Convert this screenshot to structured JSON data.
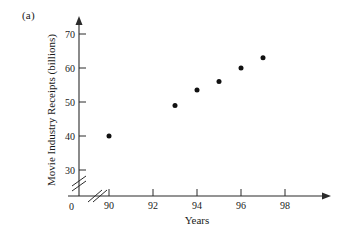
{
  "panel": {
    "label": "(a)"
  },
  "chart_data": {
    "type": "scatter",
    "title": "",
    "xlabel": "Years",
    "ylabel": "Movie Industry Receipts (billions)",
    "x": [
      90,
      93,
      94,
      95,
      96,
      97
    ],
    "values": [
      40,
      49,
      53.5,
      56,
      60,
      63
    ],
    "points": [
      {
        "x": 90,
        "y": 40
      },
      {
        "x": 93,
        "y": 49
      },
      {
        "x": 94,
        "y": 53.5
      },
      {
        "x": 95,
        "y": 56
      },
      {
        "x": 96,
        "y": 60
      },
      {
        "x": 97,
        "y": 63
      }
    ],
    "xticks": [
      90,
      92,
      94,
      96,
      98
    ],
    "xtick_labels": [
      "90",
      "92",
      "94",
      "96",
      "98"
    ],
    "yticks": [
      30,
      40,
      50,
      60,
      70
    ],
    "ytick_labels": [
      "30",
      "40",
      "50",
      "60",
      "70"
    ],
    "origin_label": "0",
    "xlim": [
      89,
      99
    ],
    "ylim": [
      28,
      74
    ],
    "grid": false,
    "legend": null,
    "axis_break_x": true,
    "axis_break_y": true,
    "marker": "filled-circle",
    "marker_color": "#111111"
  },
  "axes": {
    "x_axis_name": "years-axis",
    "y_axis_name": "receipts-axis"
  }
}
